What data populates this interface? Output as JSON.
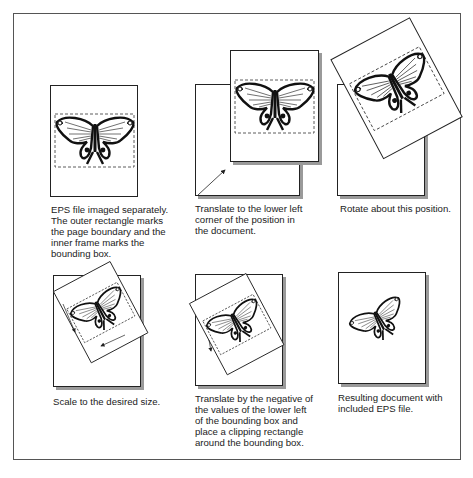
{
  "figure": {
    "panels": [
      {
        "id": "eps-separate",
        "caption": "EPS file imaged separately. The outer rectangle marks the page boundary and the inner frame marks the bounding box."
      },
      {
        "id": "translate-lower-left",
        "caption": "Translate to the lower left corner of the position in the document."
      },
      {
        "id": "rotate",
        "caption": "Rotate about this position."
      },
      {
        "id": "scale",
        "caption": "Scale to the desired size."
      },
      {
        "id": "translate-negative",
        "caption": "Translate by the negative of the values of the lower left of the bounding box and place a clipping rectangle around the bounding box."
      },
      {
        "id": "result",
        "caption": "Resulting document with included EPS file."
      }
    ]
  }
}
